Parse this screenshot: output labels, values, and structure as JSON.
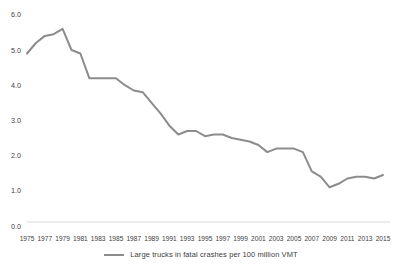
{
  "chart_data": {
    "type": "line",
    "title": "",
    "series_name": "Large trucks in fatal crashes per 100 million VMT",
    "x": [
      1975,
      1976,
      1977,
      1978,
      1979,
      1980,
      1981,
      1982,
      1983,
      1984,
      1985,
      1986,
      1987,
      1988,
      1989,
      1990,
      1991,
      1992,
      1993,
      1994,
      1995,
      1996,
      1997,
      1998,
      1999,
      2000,
      2001,
      2002,
      2003,
      2004,
      2005,
      2006,
      2007,
      2008,
      2009,
      2010,
      2011,
      2012,
      2013,
      2014,
      2015
    ],
    "values": [
      4.9,
      5.2,
      5.4,
      5.45,
      5.6,
      5.0,
      4.9,
      4.2,
      4.2,
      4.2,
      4.2,
      4.0,
      3.85,
      3.8,
      3.5,
      3.2,
      2.85,
      2.6,
      2.7,
      2.7,
      2.55,
      2.6,
      2.6,
      2.5,
      2.45,
      2.4,
      2.3,
      2.1,
      2.2,
      2.2,
      2.2,
      2.1,
      1.55,
      1.4,
      1.1,
      1.2,
      1.35,
      1.4,
      1.4,
      1.35,
      1.45
    ],
    "x_tick_labels": [
      "1975",
      "1977",
      "1979",
      "1981",
      "1983",
      "1985",
      "1987",
      "1989",
      "1991",
      "1993",
      "1995",
      "1997",
      "1999",
      "2001",
      "2003",
      "2005",
      "2007",
      "2009",
      "2011",
      "2013",
      "2015"
    ],
    "y_tick_labels": [
      "0.0",
      "1.0",
      "2.0",
      "3.0",
      "4.0",
      "5.0",
      "6.0"
    ],
    "xlabel": "",
    "ylabel": "",
    "ylim": [
      0,
      6
    ],
    "grid": false,
    "legend_position": "bottom",
    "line_color": "#8c8c8c",
    "axis_line_color": "#d9d9d9",
    "text_color": "#404040"
  }
}
